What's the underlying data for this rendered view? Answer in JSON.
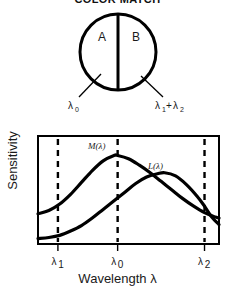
{
  "figure": {
    "title": "COLOR MATCH",
    "background": "#ffffff",
    "ink_color": "#000000"
  },
  "bipartite_field": {
    "name": "color-match-bipartite-field",
    "half_a_label": "A",
    "half_b_label": "B",
    "left_stimulus": "λ",
    "left_stimulus_sub": "0",
    "right_stimulus_a": "λ",
    "right_stimulus_a_sub": "1",
    "right_stimulus_plus": "+",
    "right_stimulus_b": "λ",
    "right_stimulus_b_sub": "2"
  },
  "chart_data": {
    "type": "line",
    "title": "COLOR MATCH",
    "xlabel": "Wavelength λ",
    "ylabel": "Sensitivity",
    "xlabel_symbol": "λ",
    "grid": false,
    "legend": "inline-labels",
    "xlim": [
      0,
      100
    ],
    "ylim": [
      0,
      100
    ],
    "xtick_positions": [
      11,
      44,
      92
    ],
    "xtick_labels": [
      "λ₁",
      "λ₀",
      "λ₂"
    ],
    "xtick_label_base": [
      "λ",
      "λ",
      "λ"
    ],
    "xtick_label_subs": [
      "1",
      "0",
      "2"
    ],
    "ytick_labels": [],
    "vertical_dashed_lines": [
      11,
      44,
      92
    ],
    "series": [
      {
        "name": "M(λ)",
        "label_base": "M",
        "label_arg": "(λ)",
        "peak_x": 44,
        "peak_y": 82,
        "x": [
          0,
          6,
          12,
          18,
          24,
          30,
          36,
          42,
          44,
          50,
          56,
          62,
          68,
          74,
          80,
          86,
          92,
          98,
          100
        ],
        "y": [
          28,
          31,
          37,
          46,
          57,
          68,
          77,
          82,
          82,
          79,
          73,
          66,
          58,
          50,
          42,
          35,
          29,
          25,
          24
        ]
      },
      {
        "name": "L(λ)",
        "label_base": "L",
        "label_arg": "(λ)",
        "peak_x": 70,
        "peak_y": 66,
        "x": [
          0,
          6,
          12,
          18,
          24,
          30,
          36,
          42,
          48,
          54,
          60,
          66,
          70,
          76,
          82,
          88,
          92,
          96,
          100
        ],
        "y": [
          5,
          6,
          8,
          12,
          17,
          24,
          32,
          40,
          48,
          56,
          62,
          65,
          66,
          63,
          55,
          44,
          35,
          25,
          18
        ]
      }
    ]
  }
}
